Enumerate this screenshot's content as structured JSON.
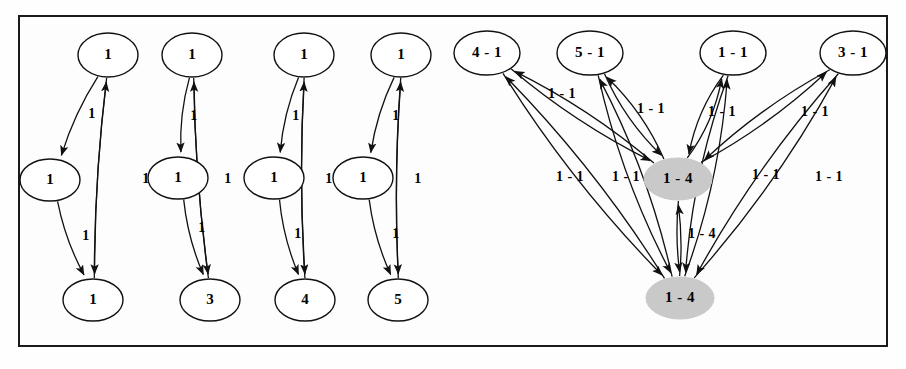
{
  "figure": {
    "title": "",
    "border_color": "#1a1a1a",
    "node_fill_plain": "#ffffff",
    "node_fill_highlight": "#c9c9c9",
    "edge_color": "#111111"
  },
  "left_clusters": [
    {
      "id": "cluster-1",
      "nodes": [
        {
          "id": "c1-top",
          "label": "1",
          "cx": 108,
          "cy": 55,
          "rx": 30,
          "ry": 22,
          "fill": "plain"
        },
        {
          "id": "c1-middle",
          "label": "1",
          "cx": 50,
          "cy": 180,
          "rx": 30,
          "ry": 21,
          "fill": "plain"
        },
        {
          "id": "c1-bottom",
          "label": "1",
          "cx": 93,
          "cy": 300,
          "rx": 30,
          "ry": 21,
          "fill": "plain"
        }
      ],
      "edge_labels": [
        {
          "text": "1",
          "x": 92,
          "y": 115
        },
        {
          "text": "1",
          "x": 146,
          "y": 180
        },
        {
          "text": "1",
          "x": 86,
          "y": 237
        }
      ]
    },
    {
      "id": "cluster-2",
      "nodes": [
        {
          "id": "c2-top",
          "label": "1",
          "cx": 192,
          "cy": 55,
          "rx": 30,
          "ry": 22,
          "fill": "plain"
        },
        {
          "id": "c2-middle",
          "label": "1",
          "cx": 178,
          "cy": 178,
          "rx": 30,
          "ry": 21,
          "fill": "plain"
        },
        {
          "id": "c2-bottom",
          "label": "3",
          "cx": 210,
          "cy": 300,
          "rx": 30,
          "ry": 21,
          "fill": "plain"
        }
      ],
      "edge_labels": [
        {
          "text": "1",
          "x": 194,
          "y": 117
        },
        {
          "text": "1",
          "x": 228,
          "y": 180
        },
        {
          "text": "1",
          "x": 202,
          "y": 229
        }
      ]
    },
    {
      "id": "cluster-3",
      "nodes": [
        {
          "id": "c3-top",
          "label": "1",
          "cx": 304,
          "cy": 55,
          "rx": 30,
          "ry": 22,
          "fill": "plain"
        },
        {
          "id": "c3-middle",
          "label": "1",
          "cx": 274,
          "cy": 178,
          "rx": 30,
          "ry": 21,
          "fill": "plain"
        },
        {
          "id": "c3-bottom",
          "label": "4",
          "cx": 305,
          "cy": 300,
          "rx": 30,
          "ry": 21,
          "fill": "plain"
        }
      ],
      "edge_labels": [
        {
          "text": "1",
          "x": 296,
          "y": 117
        },
        {
          "text": "1",
          "x": 329,
          "y": 180
        },
        {
          "text": "1",
          "x": 298,
          "y": 235
        }
      ]
    },
    {
      "id": "cluster-4",
      "nodes": [
        {
          "id": "c4-top",
          "label": "1",
          "cx": 401,
          "cy": 55,
          "rx": 30,
          "ry": 22,
          "fill": "plain"
        },
        {
          "id": "c4-middle",
          "label": "1",
          "cx": 363,
          "cy": 178,
          "rx": 30,
          "ry": 21,
          "fill": "plain"
        },
        {
          "id": "c4-bottom",
          "label": "5",
          "cx": 398,
          "cy": 300,
          "rx": 30,
          "ry": 21,
          "fill": "plain"
        }
      ],
      "edge_labels": [
        {
          "text": "1",
          "x": 396,
          "y": 117
        },
        {
          "text": "1",
          "x": 418,
          "y": 180
        },
        {
          "text": "1",
          "x": 396,
          "y": 235
        }
      ]
    }
  ],
  "right_graph": {
    "nodes": [
      {
        "id": "r-4-1",
        "label": "4 - 1",
        "cx": 487,
        "cy": 53,
        "rx": 33,
        "ry": 22,
        "fill": "plain"
      },
      {
        "id": "r-5-1",
        "label": "5 - 1",
        "cx": 590,
        "cy": 53,
        "rx": 33,
        "ry": 22,
        "fill": "plain"
      },
      {
        "id": "r-1-1",
        "label": "1 - 1",
        "cx": 733,
        "cy": 53,
        "rx": 33,
        "ry": 22,
        "fill": "plain"
      },
      {
        "id": "r-3-1",
        "label": "3 - 1",
        "cx": 853,
        "cy": 53,
        "rx": 33,
        "ry": 22,
        "fill": "plain"
      },
      {
        "id": "hub-top",
        "label": "1 - 4",
        "cx": 678,
        "cy": 179,
        "rx": 34,
        "ry": 21,
        "fill": "highlight"
      },
      {
        "id": "hub-bot",
        "label": "1 - 4",
        "cx": 680,
        "cy": 298,
        "rx": 34,
        "ry": 21,
        "fill": "highlight"
      }
    ],
    "edge_labels": [
      {
        "text": "1 - 1",
        "x": 562,
        "y": 95
      },
      {
        "text": "1 - 1",
        "x": 651,
        "y": 110
      },
      {
        "text": "1 - 1",
        "x": 722,
        "y": 113
      },
      {
        "text": "1 - 1",
        "x": 815,
        "y": 113
      },
      {
        "text": "1 - 1",
        "x": 570,
        "y": 178
      },
      {
        "text": "1 - 1",
        "x": 626,
        "y": 178
      },
      {
        "text": "1 - 1",
        "x": 766,
        "y": 176
      },
      {
        "text": "1 - 1",
        "x": 829,
        "y": 178
      },
      {
        "text": "1 - 4",
        "x": 702,
        "y": 235
      }
    ]
  }
}
